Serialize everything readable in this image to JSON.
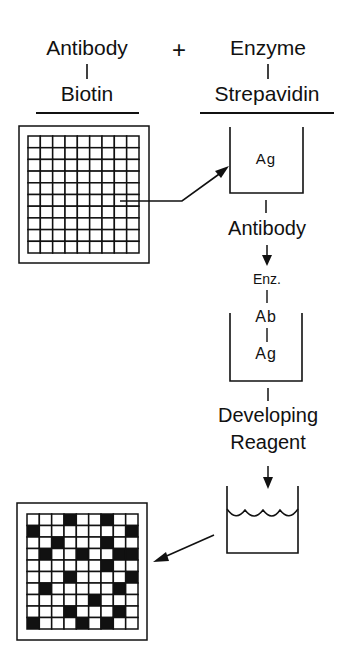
{
  "header": {
    "left_top": "Antibody",
    "left_bottom": "Biotin",
    "plus": "+",
    "right_top": "Enzyme",
    "right_bottom": "Strepavidin"
  },
  "wells": {
    "well1": {
      "label": "Ag"
    },
    "well2": {
      "top": "Enz.",
      "middle": "Ab",
      "bottom": "Ag"
    }
  },
  "steps": {
    "step1": "Antibody",
    "step2_line1": "Developing",
    "step2_line2": "Reagent"
  },
  "plates": {
    "top_plate": {
      "cols": 9,
      "rows": 10,
      "filled": []
    },
    "bottom_plate": {
      "cols": 9,
      "rows": 10,
      "filled": [
        [
          0,
          3
        ],
        [
          0,
          6
        ],
        [
          1,
          0
        ],
        [
          1,
          8
        ],
        [
          2,
          2
        ],
        [
          2,
          6
        ],
        [
          3,
          1
        ],
        [
          3,
          4
        ],
        [
          3,
          7
        ],
        [
          3,
          8
        ],
        [
          4,
          6
        ],
        [
          5,
          3
        ],
        [
          5,
          8
        ],
        [
          6,
          1
        ],
        [
          6,
          7
        ],
        [
          7,
          5
        ],
        [
          8,
          3
        ],
        [
          8,
          7
        ],
        [
          9,
          0
        ],
        [
          9,
          4
        ],
        [
          9,
          6
        ]
      ]
    }
  },
  "colors": {
    "ink": "#111111",
    "background": "#ffffff"
  }
}
